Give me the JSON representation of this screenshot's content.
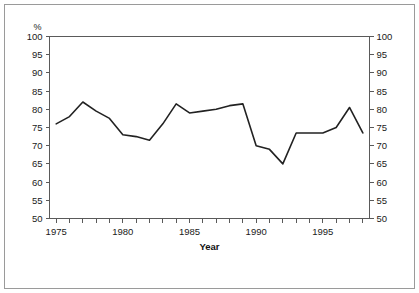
{
  "figure": {
    "unit_label": "%",
    "xaxis_title": "Year",
    "border_color": "#9a9a9a",
    "line_color": "#222222",
    "axis_color": "#5a5a5a"
  },
  "chart_data": {
    "type": "line",
    "title": "",
    "subtitle": "",
    "xlabel": "Year",
    "ylabel": "%",
    "ylim": [
      50,
      100
    ],
    "xlim": [
      1974.5,
      1998.5
    ],
    "ytick_step": 5,
    "yticks": [
      50,
      55,
      60,
      65,
      70,
      75,
      80,
      85,
      90,
      95,
      100
    ],
    "ytick_labels": [
      "50",
      "55",
      "60",
      "65",
      "70",
      "75",
      "80",
      "85",
      "90",
      "95",
      "100"
    ],
    "yticks_right": [
      50,
      55,
      60,
      65,
      70,
      75,
      80,
      85,
      90,
      95,
      100
    ],
    "ytick_labels_right": [
      "50",
      "55",
      "60",
      "65",
      "70",
      "75",
      "80",
      "85",
      "90",
      "95",
      "100"
    ],
    "xticks": [
      1975,
      1976,
      1977,
      1978,
      1979,
      1980,
      1981,
      1982,
      1983,
      1984,
      1985,
      1986,
      1987,
      1988,
      1989,
      1990,
      1991,
      1992,
      1993,
      1994,
      1995,
      1996,
      1997,
      1998
    ],
    "xtick_labels_shown": [
      "1975",
      "1980",
      "1985",
      "1990",
      "1995"
    ],
    "xtick_labels_shown_at": [
      1975,
      1980,
      1985,
      1990,
      1995
    ],
    "grid": false,
    "legend": null,
    "legend_position": "none",
    "x": [
      1975,
      1976,
      1977,
      1978,
      1979,
      1980,
      1981,
      1982,
      1983,
      1984,
      1985,
      1986,
      1987,
      1988,
      1989,
      1990,
      1991,
      1992,
      1993,
      1994,
      1995,
      1996,
      1997,
      1998
    ],
    "values": [
      76.0,
      78.0,
      82.0,
      79.5,
      77.5,
      73.0,
      72.5,
      71.5,
      76.0,
      81.5,
      79.0,
      79.5,
      80.0,
      81.0,
      81.5,
      70.0,
      69.0,
      65.0,
      73.5,
      73.5,
      73.5,
      75.0,
      80.5,
      73.5
    ]
  }
}
